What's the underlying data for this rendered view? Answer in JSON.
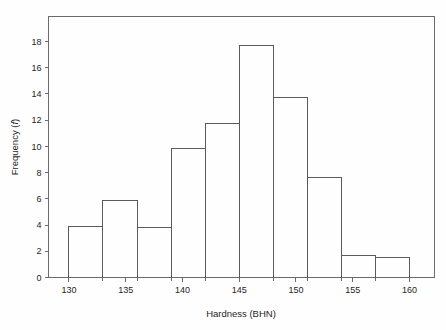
{
  "chart_data": {
    "type": "bar",
    "title": "",
    "subtitle": "",
    "xlabel": "Hardness (BHN)",
    "ylabel": "Frequency (f)",
    "ylabel_plain": "Frequency (",
    "ylabel_italic": "f",
    "ylabel_close": ")",
    "xlim": [
      128.2,
      162.2
    ],
    "ylim": [
      0,
      19.9
    ],
    "grid": false,
    "legend": null,
    "bin_width": 3,
    "bin_edges": [
      130,
      133,
      136,
      139,
      142,
      145,
      148,
      151,
      154,
      157,
      160
    ],
    "categories": [
      "130-133",
      "133-136",
      "136-139",
      "139-142",
      "142-145",
      "145-148",
      "148-151",
      "151-154",
      "154-157",
      "157-160"
    ],
    "values": [
      3.9,
      5.85,
      3.8,
      9.8,
      11.75,
      17.7,
      13.7,
      7.65,
      1.65,
      1.55
    ],
    "x_ticks_major": [
      130,
      135,
      140,
      145,
      150,
      155,
      160
    ],
    "x_tick_labels": [
      "130",
      "135",
      "140",
      "145",
      "150",
      "155",
      "160"
    ],
    "x_ticks_minor": [
      133,
      136,
      139,
      142,
      148,
      151,
      154,
      157
    ],
    "y_ticks": [
      0,
      2,
      4,
      6,
      8,
      10,
      12,
      14,
      16,
      18
    ],
    "y_tick_labels": [
      "0",
      "2",
      "4",
      "6",
      "8",
      "10",
      "12",
      "14",
      "16",
      "18"
    ],
    "colors": {
      "bar_stroke": "#5a5a5a",
      "bar_fill": "none",
      "axis": "#6b6b6b",
      "text": "#252525",
      "background": "#fefefe"
    }
  }
}
